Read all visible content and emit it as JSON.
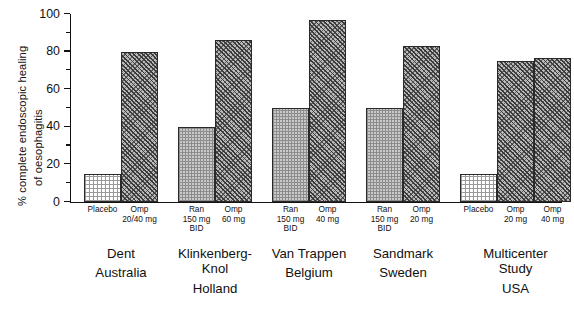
{
  "chart_data": {
    "type": "bar",
    "title": "",
    "xlabel": "",
    "ylabel": "% complete endoscopic healing of oesophagitis",
    "ylabel_line1": "% complete endoscopic healing",
    "ylabel_line2": "of oesophagitis",
    "ylim": [
      0,
      100
    ],
    "ytick_labels": [
      "0",
      "20",
      "40",
      "60",
      "80",
      "100"
    ],
    "ytick_values": [
      0,
      20,
      40,
      60,
      80,
      100
    ],
    "yminor_step": 10,
    "grid": false,
    "legend": "none",
    "categories": [
      "Dent / Australia",
      "Klinkenberg-Knol / Holland",
      "Van Trappen / Belgium",
      "Sandmark / Sweden",
      "Multicenter Study / USA"
    ],
    "groups": [
      {
        "author": "Dent",
        "country": "Australia",
        "bars": [
          {
            "label": "Placebo",
            "dose": "",
            "value": 15,
            "fill": "placebo"
          },
          {
            "label": "Omp",
            "dose": "20/40 mg",
            "value": 80,
            "fill": "omp"
          }
        ]
      },
      {
        "author": "Klinkenberg-Knol",
        "author_line1": "Klinkenberg-",
        "author_line2": "Knol",
        "country": "Holland",
        "bars": [
          {
            "label": "Ran",
            "dose": "150 mg BID",
            "value": 40,
            "fill": "ran"
          },
          {
            "label": "Omp",
            "dose": "60 mg",
            "value": 86,
            "fill": "omp"
          }
        ]
      },
      {
        "author": "Van Trappen",
        "country": "Belgium",
        "bars": [
          {
            "label": "Ran",
            "dose": "150 mg BID",
            "value": 50,
            "fill": "ran"
          },
          {
            "label": "Omp",
            "dose": "40 mg",
            "value": 97,
            "fill": "omp"
          }
        ]
      },
      {
        "author": "Sandmark",
        "country": "Sweden",
        "bars": [
          {
            "label": "Ran",
            "dose": "150 mg BID",
            "value": 50,
            "fill": "ran"
          },
          {
            "label": "Omp",
            "dose": "20 mg",
            "value": 83,
            "fill": "omp"
          }
        ]
      },
      {
        "author": "Multicenter Study",
        "author_line1": "Multicenter",
        "author_line2": "Study",
        "country": "USA",
        "bars": [
          {
            "label": "Placebo",
            "dose": "",
            "value": 15,
            "fill": "placebo"
          },
          {
            "label": "Omp",
            "dose": "20 mg",
            "value": 75,
            "fill": "omp"
          },
          {
            "label": "Omp",
            "dose": "40 mg",
            "value": 76.5,
            "fill": "omp"
          }
        ]
      }
    ]
  }
}
